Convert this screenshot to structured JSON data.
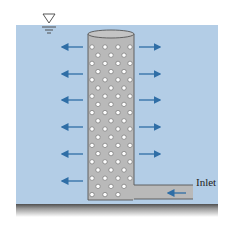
{
  "diagram": {
    "labels": {
      "inlet": "Inlet"
    },
    "icons": {
      "free_surface": "inverted-triangle-free-surface-icon"
    },
    "colors": {
      "water": "#b3cde6",
      "cylinder": "#b9b9b9",
      "cylinder_edge": "#555555",
      "hole": "#ffffff",
      "arrow": "#2f6ea6",
      "ground_top": "#5a5a5a",
      "ground_bottom": "#ffffff"
    },
    "arrows_left_count": 6,
    "arrows_right_count": 6,
    "hole_rows": 19
  }
}
